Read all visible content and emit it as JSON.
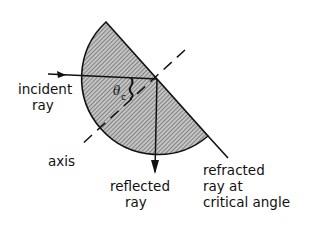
{
  "diagram": {
    "colors": {
      "ink": "#111111",
      "hatch_bg": "#bdbdbd",
      "hatch_line": "#555555",
      "background": "#ffffff"
    },
    "labels": {
      "incident_line1": "incident",
      "incident_line2": "ray",
      "axis": "axis",
      "reflected_line1": "reflected",
      "reflected_line2": "ray",
      "refracted_line1": "refracted",
      "refracted_line2": "ray at",
      "refracted_line3": "critical angle",
      "angle_symbol": "θ",
      "angle_subscript": "c"
    },
    "elements": [
      "semicircular block (hatched)",
      "incident ray (horizontal arrow)",
      "axis (dashed line, normal to flat face)",
      "reflected ray (vertical arrow down)",
      "refracted ray at critical angle (along flat face)",
      "critical angle marker θc"
    ]
  }
}
